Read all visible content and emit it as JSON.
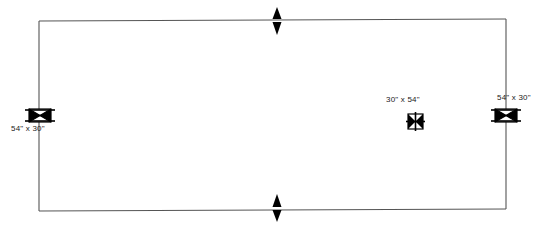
{
  "drawing": {
    "type": "floor-plan",
    "background_color": "#ffffff",
    "line_color": "#4a4a4a",
    "symbol_color": "#000000",
    "text_color": "#1a1a1a",
    "room": {
      "name": "room-outline",
      "shape": "rectangle",
      "x": 39,
      "y": 20,
      "width": 467,
      "height": 190,
      "stroke_width": 1
    },
    "fixtures": [
      {
        "name": "fixture-left-wall",
        "symbol": "bowtie-table-symbol",
        "orientation": "horizontal",
        "on_wall": "left",
        "cx": 40,
        "cy": 116,
        "label": "54\" x 30\"",
        "label_position": "below-left"
      },
      {
        "name": "fixture-interior",
        "symbol": "cross-square-symbol",
        "orientation": "vertical",
        "on_wall": "none",
        "cx": 415,
        "cy": 122,
        "label": "30\" x 54\"",
        "label_position": "above-left"
      },
      {
        "name": "fixture-right-wall",
        "symbol": "bowtie-table-symbol",
        "orientation": "horizontal",
        "on_wall": "right",
        "cx": 506,
        "cy": 116,
        "label": "54\" x 30\"",
        "label_position": "above"
      }
    ],
    "markers": [
      {
        "name": "marker-top-wall",
        "symbol": "double-arrow-vertical",
        "cx": 277,
        "cy": 22,
        "direction": "outward"
      },
      {
        "name": "marker-bottom-wall",
        "symbol": "double-arrow-vertical",
        "cx": 277,
        "cy": 209,
        "direction": "outward"
      }
    ],
    "labels": {
      "left_fixture": "54\" x 30\"",
      "center_fixture": "30\" x 54\"",
      "right_fixture": "54\" x 30\""
    }
  }
}
